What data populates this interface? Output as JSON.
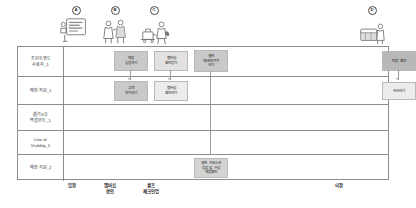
{
  "diagram": {
    "personas": [
      {
        "marker": "A",
        "icon": "kiosk-screen-illustration"
      },
      {
        "marker": "B",
        "icon": "staff-and-guest-illustration"
      },
      {
        "marker": "C",
        "icon": "luggage-handling-illustration"
      },
      {
        "marker": "D",
        "icon": "reception-desk-illustration"
      }
    ],
    "rows": [
      {
        "label": "프런트엔드\n사용자_1",
        "name": "row-frontend-user-1"
      },
      {
        "label": "매장 직원_1",
        "name": "row-store-staff-1"
      },
      {
        "label": "眞기3오\n백샐한트_1",
        "name": "row-backend-support-1"
      },
      {
        "label": "Line of\nVisibility_1",
        "name": "row-line-of-visibility-1"
      },
      {
        "label": "매장 지원_2",
        "name": "row-store-support-2"
      }
    ],
    "boxes": [
      {
        "id": "box-r1-c1",
        "text": "매장\n입장하기",
        "row": 0,
        "left": 50,
        "top": 4,
        "width": 34,
        "height": 20,
        "fill": "#c9c9c9"
      },
      {
        "id": "box-r1-c2",
        "text": "멤버십\n확인받기",
        "row": 0,
        "left": 90,
        "top": 4,
        "width": 34,
        "height": 20,
        "fill": "#e2e2e2"
      },
      {
        "id": "box-r1-c3",
        "text": "셀프\n체크인/아웃\n하기",
        "row": 0,
        "left": 130,
        "top": 3,
        "width": 34,
        "height": 22,
        "fill": "#c9c9c9"
      },
      {
        "id": "box-r1-c4",
        "text": "퇴장 확인",
        "row": 0,
        "left": 318,
        "top": 4,
        "width": 34,
        "height": 20,
        "fill": "#b8b8b8"
      },
      {
        "id": "box-r2-c1",
        "text": "고객\n맞이하기",
        "row": 1,
        "left": 50,
        "top": 4,
        "width": 34,
        "height": 20,
        "fill": "#c9c9c9"
      },
      {
        "id": "box-r2-c2",
        "text": "멤버십\n확인하기",
        "row": 1,
        "left": 90,
        "top": 4,
        "width": 34,
        "height": 20,
        "fill": "#ececec"
      },
      {
        "id": "box-r2-c4",
        "text": "인사하기",
        "row": 1,
        "left": 318,
        "top": 4,
        "width": 34,
        "height": 18,
        "fill": "#ececec"
      },
      {
        "id": "box-r5-c3",
        "text": "셀프 키오스크\n점검 및 수납\n재물확인",
        "row": 4,
        "left": 130,
        "top": 3,
        "width": 34,
        "height": 20,
        "fill": "#d4d4d4"
      }
    ],
    "stages": [
      {
        "label": "입장",
        "name": "stage-entry",
        "left": 54
      },
      {
        "label": "멤버십\n확인",
        "name": "stage-membership-check",
        "left": 92
      },
      {
        "label": "셀프\n체크인업",
        "name": "stage-self-checkin",
        "left": 132
      },
      {
        "label": "퇴장",
        "name": "stage-exit",
        "left": 322
      }
    ],
    "colors": {
      "grid_border": "#8d8d8d",
      "connector": "#9a9a9a",
      "box_border": "#b9b9b9",
      "text": "#232323"
    }
  }
}
